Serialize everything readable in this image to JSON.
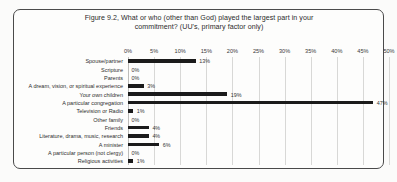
{
  "chart_data": {
    "type": "bar",
    "orientation": "horizontal",
    "title": "Figure 9.2, What or who (other than God) played the largest part in your commitment? (UU's, primary factor only)",
    "title_line1": "Figure 9.2, What or who (other than God) played the largest part in your",
    "title_line2": "commitment? (UU's, primary factor only)",
    "xlabel": "",
    "ylabel": "",
    "xlim": [
      0,
      50
    ],
    "grid": true,
    "legend": "none",
    "tick_labels": [
      "0%",
      "5%",
      "10%",
      "15%",
      "20%",
      "25%",
      "30%",
      "35%",
      "40%",
      "45%",
      "50%"
    ],
    "tick_values": [
      0,
      5,
      10,
      15,
      20,
      25,
      30,
      35,
      40,
      45,
      50
    ],
    "categories": [
      "Spouse/partner",
      "Scripture",
      "Parents",
      "A dream, vision, or spiritual experience",
      "Your own children",
      "A particular congregation",
      "Television or Radio",
      "Other family",
      "Friends",
      "Literature, drama, music, research",
      "A minister",
      "A particular person (not clergy)",
      "Religious activities"
    ],
    "values": [
      13,
      0,
      0,
      3,
      19,
      47,
      1,
      0,
      4,
      4,
      6,
      0,
      1
    ],
    "data_labels": [
      "13%",
      "0%",
      "0%",
      "3%",
      "19%",
      "47%",
      "1%",
      "0%",
      "4%",
      "4%",
      "6%",
      "0%",
      "1%"
    ],
    "bar_color": "#1b1b1b"
  }
}
